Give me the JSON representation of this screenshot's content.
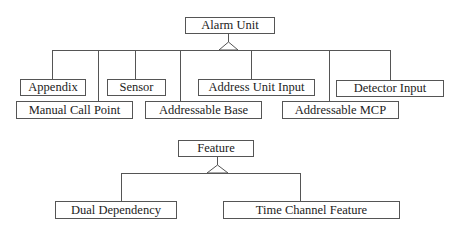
{
  "diagram": {
    "type": "class-hierarchy",
    "trees": [
      {
        "parent": {
          "label": "Alarm Unit",
          "x": 185,
          "y": 17,
          "w": 90,
          "h": 17
        },
        "inheritance_apex": [
          228,
          34
        ],
        "bus_y": 50,
        "bus_x": [
          52,
          390
        ],
        "children": [
          {
            "label": "Appendix",
            "x": 20,
            "y": 79,
            "w": 66,
            "h": 17,
            "stem_x": 52
          },
          {
            "label": "Manual Call Point",
            "x": 16,
            "y": 101,
            "w": 117,
            "h": 18,
            "stem_x": 98
          },
          {
            "label": "Sensor",
            "x": 107,
            "y": 79,
            "w": 59,
            "h": 17,
            "stem_x": 135
          },
          {
            "label": "Addressable Base",
            "x": 145,
            "y": 101,
            "w": 117,
            "h": 18,
            "stem_x": 180
          },
          {
            "label": "Address Unit Input",
            "x": 198,
            "y": 79,
            "w": 117,
            "h": 17,
            "stem_x": 251
          },
          {
            "label": "Addressable MCP",
            "x": 282,
            "y": 101,
            "w": 117,
            "h": 18,
            "stem_x": 329
          },
          {
            "label": "Detector Input",
            "x": 336,
            "y": 80,
            "w": 108,
            "h": 17,
            "stem_x": 390
          }
        ]
      },
      {
        "parent": {
          "label": "Feature",
          "x": 178,
          "y": 140,
          "w": 76,
          "h": 17
        },
        "inheritance_apex": [
          217,
          157
        ],
        "bus_y": 173,
        "bus_x": [
          121,
          300
        ],
        "children": [
          {
            "label": "Dual Dependency",
            "x": 55,
            "y": 201,
            "w": 122,
            "h": 18,
            "stem_x": 121
          },
          {
            "label": "Time Channel Feature",
            "x": 223,
            "y": 201,
            "w": 177,
            "h": 18,
            "stem_x": 300
          }
        ]
      }
    ]
  },
  "labels": {
    "alarm_unit": "Alarm Unit",
    "appendix": "Appendix",
    "manual_call_point": "Manual Call Point",
    "sensor": "Sensor",
    "addressable_base": "Addressable Base",
    "address_unit_input": "Address Unit Input",
    "addressable_mcp": "Addressable MCP",
    "detector_input": "Detector Input",
    "feature": "Feature",
    "dual_dependency": "Dual Dependency",
    "time_channel_feature": "Time Channel Feature"
  },
  "colors": {
    "line": "#555555",
    "text": "#222222",
    "background": "#ffffff"
  }
}
